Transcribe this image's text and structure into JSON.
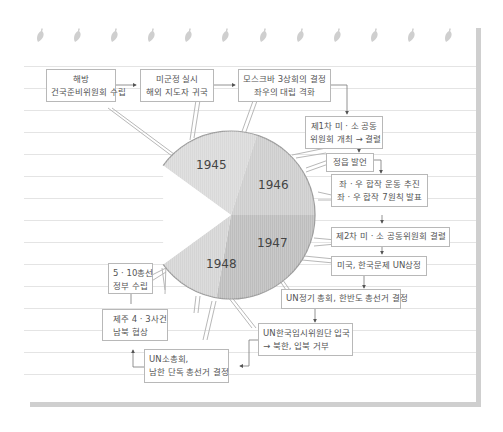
{
  "colors": {
    "slice_1945": "#d9d9d9",
    "slice_1946": "#cfcfcf",
    "slice_1947": "#bdbdbd",
    "slice_1948": "#d4d4d4",
    "box_border": "#b8b8b8",
    "ruled_line": "#e4e4e4",
    "page_shadow": "#cfcfcf"
  },
  "decoration": {
    "leaf_icon_count": 12,
    "icon": "leaf-icon"
  },
  "pie": {
    "slices": [
      {
        "label": "1945"
      },
      {
        "label": "1946"
      },
      {
        "label": "1947"
      },
      {
        "label": "1948"
      }
    ]
  },
  "events": [
    {
      "id": "e1",
      "lines": [
        "해방",
        "건국준비위원회 수립"
      ],
      "year": "1945"
    },
    {
      "id": "e2",
      "lines": [
        "미군정 실시",
        "해외 지도자 귀국"
      ],
      "year": "1945"
    },
    {
      "id": "e3",
      "lines": [
        "모스크바 3상회의 결정",
        "좌우의 대립 격화"
      ],
      "year": "1945"
    },
    {
      "id": "e4",
      "lines": [
        "제1차 미 · 소 공동",
        "위원회 개최 → 결렬"
      ],
      "year": "1946"
    },
    {
      "id": "e5",
      "lines": [
        "정읍 발언"
      ],
      "year": "1946"
    },
    {
      "id": "e6",
      "lines": [
        "좌 · 우 합작 운동 추진",
        "좌 · 우 합작 7원칙 발표"
      ],
      "year": "1946"
    },
    {
      "id": "e7",
      "lines": [
        "제2차 미 · 소 공동위원회 결렬"
      ],
      "year": "1947"
    },
    {
      "id": "e8",
      "lines": [
        "미국, 한국문제 UN상정"
      ],
      "year": "1947"
    },
    {
      "id": "e9",
      "lines": [
        "UN정기 총회, 한반도 총선거 결정"
      ],
      "year": "1947"
    },
    {
      "id": "e10",
      "lines": [
        "UN한국임시위원단 입국",
        "→ 북한, 입북 거부"
      ],
      "year": "1948"
    },
    {
      "id": "e11",
      "lines": [
        "UN소총회,",
        "남한 단독 총선거 결정"
      ],
      "year": "1948"
    },
    {
      "id": "e12",
      "lines": [
        "제주 4 · 3사건",
        "남북 협상"
      ],
      "year": "1948"
    },
    {
      "id": "e13",
      "lines": [
        "5 · 10총선",
        "정부 수립"
      ],
      "year": "1948"
    }
  ]
}
